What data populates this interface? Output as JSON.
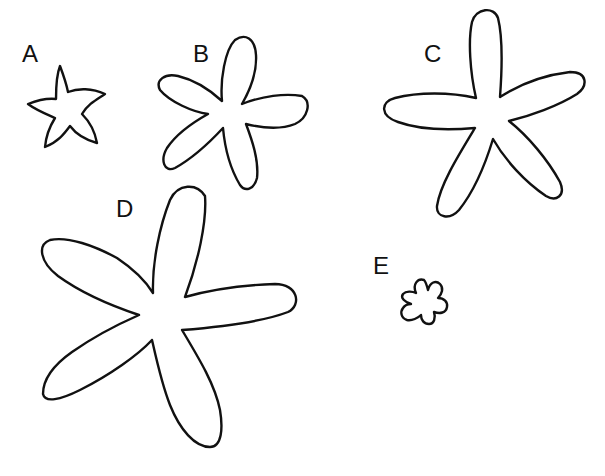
{
  "figure": {
    "shapes": [
      {
        "id": "A",
        "label": "A",
        "petals": 5,
        "size": "small",
        "style": "pointed star"
      },
      {
        "id": "B",
        "label": "B",
        "petals": 5,
        "size": "medium",
        "style": "rounded elongated petals"
      },
      {
        "id": "C",
        "label": "C",
        "petals": 5,
        "size": "large",
        "style": "rounded elongated petals"
      },
      {
        "id": "D",
        "label": "D",
        "petals": 5,
        "size": "largest",
        "style": "rounded elongated petals"
      },
      {
        "id": "E",
        "label": "E",
        "petals": 5,
        "size": "smallest",
        "style": "rounded scalloped"
      }
    ],
    "stroke_color": "#111111",
    "background_color": "#ffffff"
  }
}
